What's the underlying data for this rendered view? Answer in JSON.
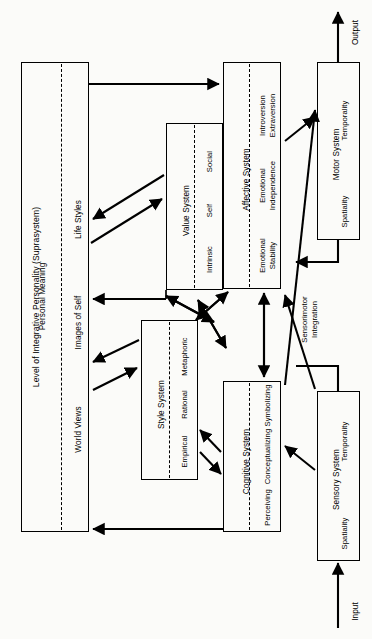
{
  "diagram": {
    "title": "Level of Integrative Personality (Suprasystem)",
    "subtitle": "Personal Meaning",
    "io": {
      "input": "Input",
      "output": "Output"
    },
    "bridge_label": "Sensorimotor\nIntegration",
    "suprasystem": {
      "name": "Level of Integrative Personality (Suprasystem)",
      "layer": "Personal Meaning",
      "components": [
        "World Views",
        "Images of Self",
        "Life Styles"
      ]
    },
    "systems": [
      {
        "id": "value",
        "name": "Value System",
        "components": [
          "Intrinsic",
          "Self",
          "Social"
        ]
      },
      {
        "id": "style",
        "name": "Style System",
        "components": [
          "Empirical",
          "Rational",
          "Metaphoric"
        ]
      },
      {
        "id": "affective",
        "name": "Affective System",
        "components": [
          "Emotional\nStability",
          "Emotional\nIndependence",
          "Introversion\nExtraversion"
        ]
      },
      {
        "id": "cognitive",
        "name": "Cognitive System",
        "components": [
          "Perceiving",
          "Conceptualizing",
          "Symbolizing"
        ]
      },
      {
        "id": "motor",
        "name": "Motor System",
        "components": [
          "Spatiality",
          "Temporality"
        ]
      },
      {
        "id": "sensory",
        "name": "Sensory System",
        "components": [
          "Spatiality",
          "Temporality"
        ]
      }
    ]
  }
}
